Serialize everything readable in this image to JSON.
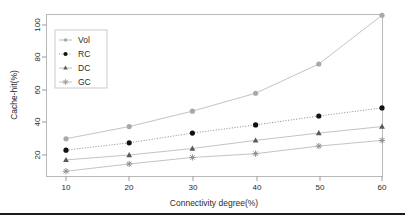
{
  "chart_data": {
    "type": "line",
    "title": "",
    "xlabel": "Connectivity degree(%)",
    "ylabel": "Cache-hit(%)",
    "x": [
      10,
      20,
      30,
      40,
      50,
      60
    ],
    "categories": [
      "10",
      "20",
      "30",
      "40",
      "50",
      "60"
    ],
    "xtick_labels": [
      "10",
      "20",
      "30",
      "40",
      "50",
      "60"
    ],
    "ytick_labels": [
      "20",
      "40",
      "60",
      "80",
      "100"
    ],
    "ytick_values": [
      20,
      40,
      60,
      80,
      100
    ],
    "xlim": [
      7,
      63
    ],
    "ylim": [
      7,
      110
    ],
    "grid": false,
    "legend_position": "upper-left-inside",
    "series": [
      {
        "name": "Vol",
        "values": [
          30,
          37.5,
          47,
          58,
          76,
          106
        ],
        "marker": "circle-open-gray",
        "line_style": "solid",
        "color": "#a8a8a8"
      },
      {
        "name": "RC",
        "values": [
          23,
          27.5,
          33.5,
          38.5,
          44,
          49
        ],
        "marker": "circle-filled",
        "line_style": "dotted",
        "color": "#1a1a1a"
      },
      {
        "name": "DC",
        "values": [
          17,
          20,
          24,
          29,
          33.5,
          37.5
        ],
        "marker": "triangle",
        "line_style": "solid",
        "color": "#6e6e6e"
      },
      {
        "name": "GC",
        "values": [
          10,
          14.5,
          18.5,
          20.8,
          25.5,
          29
        ],
        "marker": "star",
        "line_style": "solid",
        "color": "#9a9a9a"
      }
    ]
  },
  "legend": {
    "entries": [
      {
        "label": "Vol"
      },
      {
        "label": "RC"
      },
      {
        "label": "DC"
      },
      {
        "label": "GC"
      }
    ]
  },
  "footer": {
    "rule": ""
  }
}
